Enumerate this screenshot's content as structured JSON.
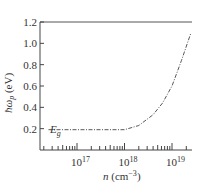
{
  "chart_data": {
    "type": "line",
    "title": "",
    "xlabel": "n (cm⁻³)",
    "ylabel": "ħω₀ (eV)",
    "xscale": "log",
    "xlim": [
      3000000000000000.0,
      2e+19
    ],
    "ylim": [
      0,
      1.2
    ],
    "x_ticks": [
      {
        "value": 1e+17,
        "label": "10",
        "exp": "17"
      },
      {
        "value": 1e+18,
        "label": "10",
        "exp": "18"
      },
      {
        "value": 1e+19,
        "label": "10",
        "exp": "19"
      }
    ],
    "y_ticks": [
      "0.2",
      "0.4",
      "0.6",
      "0.8",
      "1.0",
      "1.2"
    ],
    "annotations": [
      {
        "text": "E",
        "sub": "g",
        "x": 3e+16,
        "y": 0.2
      }
    ],
    "series": [
      {
        "name": "plasma energy",
        "style": "dash-dot",
        "log10_x": [
          16.4,
          17.0,
          17.5,
          18.0,
          18.3,
          18.6,
          18.8,
          19.0,
          19.2,
          19.4
        ],
        "y": [
          0.19,
          0.19,
          0.19,
          0.19,
          0.23,
          0.33,
          0.44,
          0.6,
          0.84,
          1.1
        ]
      }
    ],
    "grid": false,
    "legend": null
  },
  "labels": {
    "x_axis": "n (cm",
    "x_axis_exp": "−3",
    "x_axis_close": ")",
    "y_axis": "ħω",
    "y_axis_sub": "p",
    "y_axis_unit": " (eV)",
    "eg": "E",
    "eg_sub": "g"
  }
}
